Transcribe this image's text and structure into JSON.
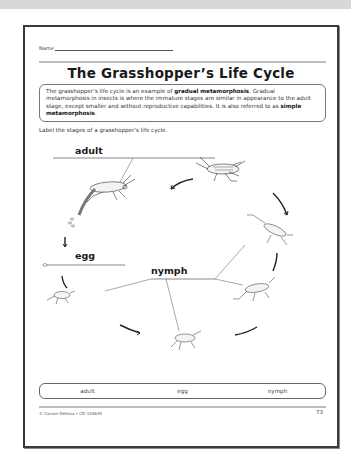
{
  "worksheet": {
    "name_label": "Name",
    "title": "The Grasshopper’s Life Cycle",
    "intro": {
      "part1": "The grasshopper’s life cycle is an example of ",
      "bold1": "gradual metamorphosis",
      "part2": ". Gradual metamorphosis in insects is where the immature stages are similar in appearance to the adult stage, except smaller and without reproductive capabilities. It is also referred to as ",
      "bold2": "simple metamorphosis",
      "part3": "."
    },
    "instructions": "Label the stages of a grasshopper’s life cycle.",
    "diagram": {
      "labels": {
        "adult": "adult",
        "egg": "egg",
        "nymph": "nymph"
      },
      "icons": [
        "adult-grasshopper-icon",
        "egg-icon",
        "nymph-grasshopper-icon",
        "cycle-arrow-icon"
      ]
    },
    "word_bank": [
      "adult",
      "egg",
      "nymph"
    ],
    "footer": {
      "copyright": "© Carson-Dellosa • CD-104639",
      "page_number": "73"
    }
  }
}
